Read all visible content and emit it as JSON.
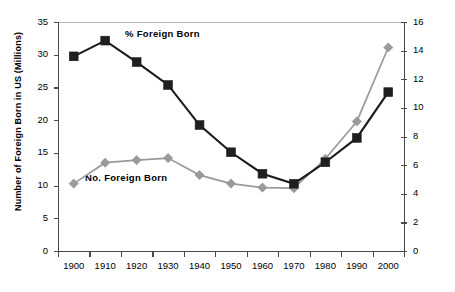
{
  "chart_data": {
    "type": "line",
    "title": "",
    "xlabel": "",
    "ylabel": "Number of Foreign Born in US (Millions)",
    "y2label": "Percent Foreign Born",
    "categories": [
      "1900",
      "1910",
      "1920",
      "1930",
      "1940",
      "1950",
      "1960",
      "1970",
      "1980",
      "1990",
      "2000"
    ],
    "ylim": [
      0,
      35
    ],
    "yticks": [
      "0",
      "5",
      "10",
      "15",
      "20",
      "25",
      "30",
      "35"
    ],
    "y2lim": [
      0,
      16
    ],
    "y2ticks": [
      "0",
      "2",
      "4",
      "6",
      "8",
      "10",
      "12",
      "14",
      "16"
    ],
    "grid": false,
    "legend_position": "inline-annotation",
    "series": [
      {
        "name": "% Foreign Born",
        "axis": "right",
        "marker": "square",
        "color": "#1f1f1f",
        "values": [
          13.6,
          14.7,
          13.2,
          11.6,
          8.8,
          6.9,
          5.4,
          4.7,
          6.2,
          7.9,
          11.1
        ]
      },
      {
        "name": "No. Foreign Born",
        "axis": "left",
        "marker": "diamond",
        "color": "#9a9a9a",
        "values": [
          10.3,
          13.5,
          13.9,
          14.2,
          11.6,
          10.3,
          9.7,
          9.6,
          14.1,
          19.8,
          31.1
        ]
      }
    ],
    "annotations": [
      {
        "text": "% Foreign Born",
        "series": "% Foreign Born"
      },
      {
        "text": "No. Foreign Born",
        "series": "No. Foreign Born"
      }
    ]
  }
}
